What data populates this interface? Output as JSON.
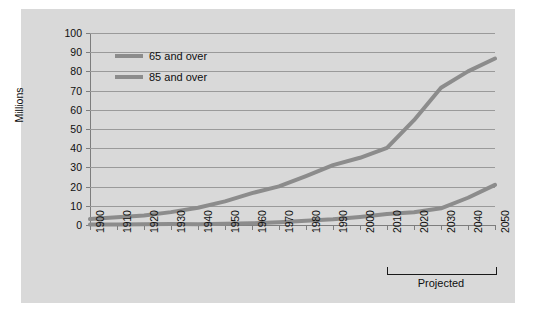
{
  "chart_data": {
    "type": "line",
    "title": "",
    "xlabel": "",
    "ylabel": "Millions",
    "ylim": [
      0,
      100
    ],
    "ytick_values": [
      0,
      10,
      20,
      30,
      40,
      50,
      60,
      70,
      80,
      90,
      100
    ],
    "ytick_labels": [
      "0",
      "10",
      "20",
      "30",
      "40",
      "50",
      "60",
      "70",
      "80",
      "90",
      "100"
    ],
    "grid": true,
    "legend_position": "top-left",
    "categories": [
      "1900",
      "1910",
      "1920",
      "1930",
      "1940",
      "1950",
      "1960",
      "1970",
      "1980",
      "1990",
      "2000",
      "2010",
      "2020",
      "2030",
      "2040",
      "2050"
    ],
    "series": [
      {
        "name": "65 and over",
        "color": "#8c8c8c",
        "values": [
          3.1,
          4.0,
          4.9,
          6.7,
          9.0,
          12.3,
          16.6,
          20.1,
          25.5,
          31.2,
          35.0,
          40.2,
          54.6,
          71.5,
          80.0,
          86.7
        ]
      },
      {
        "name": "85 and over",
        "color": "#8c8c8c",
        "values": [
          0.2,
          0.3,
          0.4,
          0.5,
          0.4,
          0.6,
          0.9,
          1.4,
          2.2,
          3.0,
          4.2,
          5.7,
          6.6,
          8.7,
          14.2,
          20.9
        ]
      }
    ],
    "annotations": [
      {
        "text": "Projected",
        "span_from": "2010",
        "span_to": "2050",
        "type": "bracket"
      }
    ]
  },
  "legend": {
    "items": [
      {
        "label": "65 and over",
        "color": "#8c8c8c"
      },
      {
        "label": "85 and over",
        "color": "#8c8c8c"
      }
    ]
  },
  "axes": {
    "y_title": "Millions"
  },
  "colors": {
    "panel_background": "#d9d9d9",
    "page_background": "#ffffff",
    "gridline": "#9a9a9a",
    "axis": "#7d7d7d",
    "series_line": "#8c8c8c",
    "text": "#0f0f0f"
  }
}
